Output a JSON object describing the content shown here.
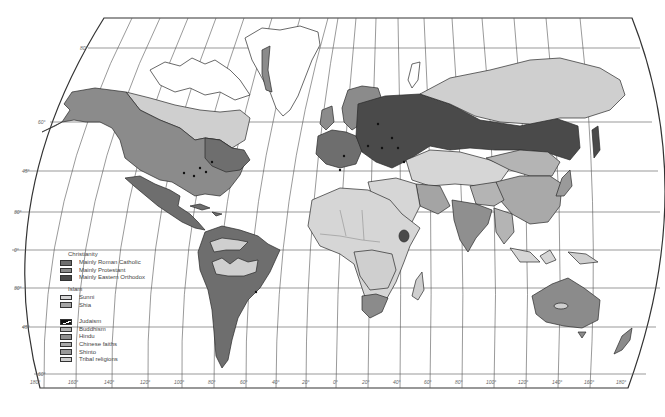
{
  "map": {
    "title": "World religions",
    "colors": {
      "roman_catholic": "#6e6e6e",
      "protestant": "#8b8b8b",
      "eastern_orthodox": "#4a4a4a",
      "sunni": "#d6d6d6",
      "shia": "#a4a4a4",
      "judaism": "#111111",
      "buddhism": "#b4b4b4",
      "hindu": "#8f8f8f",
      "chinese_faiths": "#a9a9a9",
      "shinto": "#9a9a9a",
      "tribal": "#cfcfcf",
      "ocean": "#ffffff",
      "unpopulated": "#ffffff"
    },
    "latitude_labels": [
      "80°",
      "60°",
      "45°",
      "30°",
      "0°",
      "30°",
      "45°",
      "60°"
    ],
    "longitude_labels": [
      "180°",
      "160°",
      "140°",
      "120°",
      "100°",
      "80°",
      "60°",
      "40°",
      "20°",
      "0°",
      "20°",
      "40°",
      "60°",
      "80°",
      "100°",
      "120°",
      "140°",
      "160°",
      "180°"
    ]
  },
  "legend": {
    "christianity": {
      "title": "Christianity",
      "items": [
        {
          "label": "Mainly Roman Catholic"
        },
        {
          "label": "Mainly Protestant"
        },
        {
          "label": "Mainly Eastern Orthodox"
        }
      ]
    },
    "islam": {
      "title": "Islam",
      "items": [
        {
          "label": "Sunni"
        },
        {
          "label": "Shia"
        }
      ]
    },
    "other": {
      "items": [
        {
          "label": "Judaism"
        },
        {
          "label": "Buddhism"
        },
        {
          "label": "Hindu"
        },
        {
          "label": "Chinese faiths"
        },
        {
          "label": "Shinto"
        },
        {
          "label": "Tribal religions"
        }
      ]
    }
  }
}
